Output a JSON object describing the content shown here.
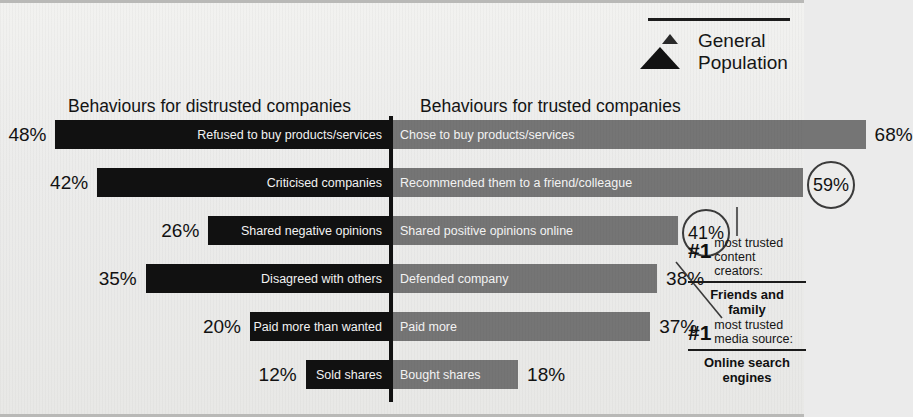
{
  "legend": {
    "icon": "pyramid-icon",
    "line1": "General",
    "line2": "Population"
  },
  "headings": {
    "left": "Behaviours for distrusted companies",
    "right": "Behaviours for trusted companies"
  },
  "callouts": [
    {
      "rank": "#1",
      "line1": "most trusted",
      "line2": "content creators:",
      "answer_line1": "Friends and",
      "answer_line2": "family"
    },
    {
      "rank": "#1",
      "line1": "most trusted",
      "line2": "media source:",
      "answer_line1": "Online search",
      "answer_line2": "engines"
    }
  ],
  "chart_data": {
    "type": "bar",
    "title": "",
    "subtype": "diverging-paired-bar",
    "xlabel": "",
    "ylabel": "",
    "value_unit": "%",
    "left_title": "Behaviours for distrusted companies",
    "right_title": "Behaviours for trusted companies",
    "series": [
      {
        "name": "Behaviours for distrusted companies",
        "color": "#111111"
      },
      {
        "name": "Behaviours for trusted companies",
        "color": "#757575"
      }
    ],
    "rows": [
      {
        "left_label": "Refused to buy products/services",
        "left_value": 48,
        "left_value_text": "48%",
        "right_label": "Chose to buy products/services",
        "right_value": 68,
        "right_value_text": "68%",
        "right_circled": false
      },
      {
        "left_label": "Criticised companies",
        "left_value": 42,
        "left_value_text": "42%",
        "right_label": "Recommended them to a friend/colleague",
        "right_value": 59,
        "right_value_text": "59%",
        "right_circled": true
      },
      {
        "left_label": "Shared negative opinions",
        "left_value": 26,
        "left_value_text": "26%",
        "right_label": "Shared positive opinions online",
        "right_value": 41,
        "right_value_text": "41%",
        "right_circled": true
      },
      {
        "left_label": "Disagreed with others",
        "left_value": 35,
        "left_value_text": "35%",
        "right_label": "Defended company",
        "right_value": 38,
        "right_value_text": "38%",
        "right_circled": false
      },
      {
        "left_label": "Paid more than wanted",
        "left_value": 20,
        "left_value_text": "20%",
        "right_label": "Paid more",
        "right_value": 37,
        "right_value_text": "37%",
        "right_circled": false
      },
      {
        "left_label": "Sold shares",
        "left_value": 12,
        "left_value_text": "12%",
        "right_label": "Bought shares",
        "right_value": 18,
        "right_value_text": "18%",
        "right_circled": false
      }
    ]
  }
}
